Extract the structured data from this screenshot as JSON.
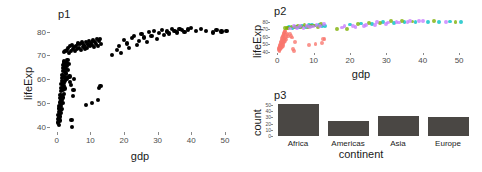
{
  "figure": {
    "layout": "three-panel-patchwork",
    "background": "#ffffff"
  },
  "panels": {
    "p1": {
      "title": "p1",
      "xlabel": "gdp",
      "ylabel": "lifeExp"
    },
    "p2": {
      "title": "p2",
      "xlabel": "gdp",
      "ylabel": "lifeExp"
    },
    "p3": {
      "title": "p3",
      "xlabel": "continent",
      "ylabel": "count"
    }
  },
  "colors": {
    "point_black": "#000000",
    "bar_fill": "#4a4744",
    "africa": "#F8766D",
    "americas": "#7CAE00",
    "asia": "#00BFC4",
    "europe": "#C77CFF",
    "axis_text": "#4d4d4d",
    "label_text": "#1a1a1a"
  },
  "chart_data": [
    {
      "id": "p1",
      "type": "scatter",
      "title": "p1",
      "xlabel": "gdp",
      "ylabel": "lifeExp",
      "xlim": [
        -2,
        53
      ],
      "ylim": [
        38,
        84
      ],
      "xticks": [
        0,
        10,
        20,
        30,
        40,
        50
      ],
      "yticks": [
        40,
        50,
        60,
        70,
        80
      ],
      "grid": false,
      "legend": "none",
      "point_color": "#000000",
      "points": [
        [
          0.4,
          42.0
        ],
        [
          0.5,
          43.5
        ],
        [
          0.5,
          45.2
        ],
        [
          0.6,
          41.0
        ],
        [
          0.6,
          46.5
        ],
        [
          0.7,
          44.1
        ],
        [
          0.7,
          47.8
        ],
        [
          0.8,
          42.8
        ],
        [
          0.8,
          48.9
        ],
        [
          0.9,
          46.0
        ],
        [
          0.9,
          50.3
        ],
        [
          1.0,
          44.5
        ],
        [
          1.0,
          52.1
        ],
        [
          1.1,
          47.2
        ],
        [
          1.1,
          53.6
        ],
        [
          1.2,
          45.8
        ],
        [
          1.2,
          55.0
        ],
        [
          1.3,
          49.0
        ],
        [
          1.3,
          56.4
        ],
        [
          1.4,
          51.5
        ],
        [
          1.4,
          58.0
        ],
        [
          1.5,
          47.5
        ],
        [
          1.5,
          59.3
        ],
        [
          1.6,
          53.2
        ],
        [
          1.6,
          60.7
        ],
        [
          1.7,
          50.0
        ],
        [
          1.7,
          62.0
        ],
        [
          1.8,
          55.8
        ],
        [
          1.8,
          63.4
        ],
        [
          1.9,
          52.4
        ],
        [
          1.9,
          64.8
        ],
        [
          2.0,
          57.1
        ],
        [
          2.0,
          65.9
        ],
        [
          2.1,
          54.0
        ],
        [
          2.1,
          66.8
        ],
        [
          2.2,
          58.6
        ],
        [
          2.2,
          67.5
        ],
        [
          2.3,
          56.2
        ],
        [
          2.3,
          61.0
        ],
        [
          2.4,
          63.0
        ],
        [
          2.4,
          65.0
        ],
        [
          2.5,
          59.5
        ],
        [
          2.6,
          66.2
        ],
        [
          2.7,
          62.5
        ],
        [
          2.8,
          64.2
        ],
        [
          2.9,
          67.0
        ],
        [
          3.0,
          60.4
        ],
        [
          3.1,
          65.5
        ],
        [
          3.2,
          68.0
        ],
        [
          3.4,
          63.8
        ],
        [
          3.6,
          66.5
        ],
        [
          3.8,
          61.2
        ],
        [
          4.0,
          59.0
        ],
        [
          4.2,
          57.5
        ],
        [
          4.4,
          43.0
        ],
        [
          4.6,
          40.2
        ],
        [
          4.8,
          53.0
        ],
        [
          5.0,
          55.5
        ],
        [
          5.2,
          60.0
        ],
        [
          2.2,
          71.5
        ],
        [
          2.6,
          71.8
        ],
        [
          3.0,
          72.3
        ],
        [
          3.3,
          73.0
        ],
        [
          3.6,
          71.2
        ],
        [
          3.9,
          73.8
        ],
        [
          4.2,
          72.0
        ],
        [
          4.5,
          74.5
        ],
        [
          4.8,
          72.8
        ],
        [
          5.1,
          73.4
        ],
        [
          5.4,
          71.9
        ],
        [
          5.7,
          74.0
        ],
        [
          6.0,
          72.6
        ],
        [
          6.3,
          75.0
        ],
        [
          6.6,
          73.2
        ],
        [
          6.9,
          74.8
        ],
        [
          7.2,
          72.2
        ],
        [
          7.5,
          75.4
        ],
        [
          7.8,
          73.6
        ],
        [
          8.1,
          74.2
        ],
        [
          8.4,
          72.9
        ],
        [
          8.7,
          75.8
        ],
        [
          9.0,
          73.1
        ],
        [
          9.3,
          74.6
        ],
        [
          9.6,
          76.0
        ],
        [
          9.9,
          73.9
        ],
        [
          10.2,
          75.2
        ],
        [
          10.5,
          74.4
        ],
        [
          10.8,
          76.3
        ],
        [
          11.1,
          73.5
        ],
        [
          11.4,
          75.6
        ],
        [
          11.7,
          74.9
        ],
        [
          12.0,
          76.8
        ],
        [
          12.3,
          74.1
        ],
        [
          12.6,
          75.9
        ],
        [
          12.9,
          77.0
        ],
        [
          13.2,
          74.7
        ],
        [
          8.8,
          49.2
        ],
        [
          10.5,
          50.0
        ],
        [
          12.2,
          51.5
        ],
        [
          12.6,
          56.5
        ],
        [
          13.0,
          57.2
        ],
        [
          16.5,
          70.2
        ],
        [
          17.8,
          72.4
        ],
        [
          18.5,
          74.0
        ],
        [
          19.2,
          71.0
        ],
        [
          20.0,
          76.5
        ],
        [
          20.8,
          75.0
        ],
        [
          21.5,
          73.0
        ],
        [
          22.3,
          77.2
        ],
        [
          23.0,
          78.0
        ],
        [
          23.8,
          74.5
        ],
        [
          24.5,
          76.0
        ],
        [
          25.2,
          79.0
        ],
        [
          26.0,
          77.5
        ],
        [
          26.8,
          75.5
        ],
        [
          27.5,
          79.8
        ],
        [
          28.2,
          78.2
        ],
        [
          29.0,
          80.2
        ],
        [
          29.8,
          76.8
        ],
        [
          30.5,
          79.4
        ],
        [
          31.2,
          80.8
        ],
        [
          32.0,
          78.6
        ],
        [
          32.8,
          80.0
        ],
        [
          33.5,
          79.2
        ],
        [
          34.2,
          81.0
        ],
        [
          35.0,
          80.4
        ],
        [
          35.8,
          79.6
        ],
        [
          36.5,
          81.2
        ],
        [
          37.2,
          80.6
        ],
        [
          38.0,
          79.9
        ],
        [
          39.0,
          80.9
        ],
        [
          40.0,
          81.4
        ],
        [
          41.5,
          80.1
        ],
        [
          43.0,
          81.0
        ],
        [
          44.5,
          80.3
        ],
        [
          46.5,
          79.6
        ],
        [
          47.5,
          80.6
        ],
        [
          49.0,
          80.0
        ],
        [
          50.5,
          80.4
        ]
      ]
    },
    {
      "id": "p2",
      "type": "scatter",
      "title": "p2",
      "xlabel": "gdp",
      "ylabel": "lifeExp",
      "xlim": [
        -2,
        53
      ],
      "ylim": [
        38,
        84
      ],
      "xticks": [
        0,
        10,
        20,
        30,
        40,
        50
      ],
      "yticks": [
        40,
        50,
        60,
        70,
        80
      ],
      "grid": false,
      "legend": "none",
      "color_by": "continent",
      "series": [
        {
          "name": "Africa",
          "color": "#F8766D",
          "points": [
            [
              0.4,
              42.0
            ],
            [
              0.5,
              43.5
            ],
            [
              0.5,
              45.2
            ],
            [
              0.6,
              41.0
            ],
            [
              0.6,
              46.5
            ],
            [
              0.7,
              44.1
            ],
            [
              0.7,
              47.8
            ],
            [
              0.8,
              42.8
            ],
            [
              0.8,
              48.9
            ],
            [
              0.9,
              46.0
            ],
            [
              0.9,
              50.3
            ],
            [
              1.0,
              44.5
            ],
            [
              1.0,
              52.1
            ],
            [
              1.1,
              47.2
            ],
            [
              1.1,
              53.6
            ],
            [
              1.2,
              45.8
            ],
            [
              1.2,
              55.0
            ],
            [
              1.3,
              49.0
            ],
            [
              1.3,
              56.4
            ],
            [
              1.4,
              51.5
            ],
            [
              1.4,
              58.0
            ],
            [
              1.5,
              47.5
            ],
            [
              1.5,
              59.3
            ],
            [
              1.6,
              53.2
            ],
            [
              1.6,
              60.7
            ],
            [
              1.7,
              50.0
            ],
            [
              1.7,
              62.0
            ],
            [
              1.8,
              55.8
            ],
            [
              1.8,
              63.4
            ],
            [
              1.9,
              52.4
            ],
            [
              1.9,
              64.8
            ],
            [
              2.0,
              57.1
            ],
            [
              2.0,
              65.9
            ],
            [
              2.1,
              54.0
            ],
            [
              2.1,
              66.8
            ],
            [
              2.2,
              58.6
            ],
            [
              2.2,
              67.5
            ],
            [
              2.3,
              56.2
            ],
            [
              2.4,
              63.0
            ],
            [
              2.5,
              59.5
            ],
            [
              2.8,
              64.2
            ],
            [
              3.0,
              60.4
            ],
            [
              3.4,
              63.8
            ],
            [
              3.8,
              61.2
            ],
            [
              4.0,
              59.0
            ],
            [
              4.4,
              43.0
            ],
            [
              4.6,
              40.2
            ],
            [
              4.8,
              53.0
            ],
            [
              8.8,
              49.2
            ],
            [
              10.5,
              50.0
            ],
            [
              12.2,
              51.5
            ],
            [
              12.6,
              56.5
            ],
            [
              13.0,
              57.2
            ]
          ]
        },
        {
          "name": "Americas",
          "color": "#00BFC4",
          "points": [
            [
              3.3,
              73.0
            ],
            [
              4.2,
              72.0
            ],
            [
              5.1,
              73.4
            ],
            [
              6.0,
              72.6
            ],
            [
              6.9,
              74.8
            ],
            [
              7.8,
              73.6
            ],
            [
              8.7,
              75.8
            ],
            [
              9.6,
              76.0
            ],
            [
              10.5,
              75.2
            ],
            [
              11.4,
              75.6
            ],
            [
              12.3,
              74.1
            ],
            [
              13.2,
              74.7
            ],
            [
              20.0,
              76.5
            ],
            [
              23.0,
              78.0
            ],
            [
              26.0,
              77.5
            ],
            [
              29.0,
              80.2
            ],
            [
              32.0,
              78.6
            ],
            [
              35.0,
              80.4
            ],
            [
              38.0,
              79.9
            ],
            [
              41.5,
              80.1
            ],
            [
              44.5,
              80.3
            ],
            [
              47.5,
              80.6
            ],
            [
              50.5,
              80.4
            ]
          ]
        },
        {
          "name": "Asia",
          "color": "#7CAE00",
          "points": [
            [
              2.2,
              71.5
            ],
            [
              2.6,
              71.8
            ],
            [
              3.0,
              72.3
            ],
            [
              3.9,
              73.8
            ],
            [
              4.8,
              72.8
            ],
            [
              5.7,
              74.0
            ],
            [
              6.6,
              73.2
            ],
            [
              7.5,
              75.4
            ],
            [
              8.4,
              72.9
            ],
            [
              9.3,
              74.6
            ],
            [
              10.2,
              75.2
            ],
            [
              11.1,
              73.5
            ],
            [
              12.0,
              76.8
            ],
            [
              16.5,
              70.2
            ],
            [
              19.2,
              71.0
            ],
            [
              22.3,
              77.2
            ],
            [
              25.2,
              79.0
            ],
            [
              28.2,
              78.2
            ],
            [
              31.2,
              80.8
            ],
            [
              34.2,
              81.0
            ],
            [
              37.2,
              80.6
            ],
            [
              43.0,
              81.0
            ],
            [
              49.0,
              80.0
            ]
          ]
        },
        {
          "name": "Europe",
          "color": "#C77CFF",
          "points": [
            [
              3.6,
              71.2
            ],
            [
              4.5,
              74.5
            ],
            [
              5.4,
              71.9
            ],
            [
              6.3,
              75.0
            ],
            [
              7.2,
              72.2
            ],
            [
              8.1,
              74.2
            ],
            [
              9.0,
              73.1
            ],
            [
              9.9,
              73.9
            ],
            [
              10.8,
              76.3
            ],
            [
              11.7,
              74.9
            ],
            [
              12.9,
              77.0
            ],
            [
              17.8,
              72.4
            ],
            [
              18.5,
              74.0
            ],
            [
              20.8,
              75.0
            ],
            [
              21.5,
              73.0
            ],
            [
              23.8,
              74.5
            ],
            [
              24.5,
              76.0
            ],
            [
              26.8,
              75.5
            ],
            [
              27.5,
              79.8
            ],
            [
              29.8,
              76.8
            ],
            [
              30.5,
              79.4
            ],
            [
              32.8,
              80.0
            ],
            [
              33.5,
              79.2
            ],
            [
              35.8,
              79.6
            ],
            [
              36.5,
              81.2
            ],
            [
              39.0,
              80.9
            ],
            [
              40.0,
              81.4
            ],
            [
              46.5,
              79.6
            ]
          ]
        }
      ]
    },
    {
      "id": "p3",
      "type": "bar",
      "title": "p3",
      "xlabel": "continent",
      "ylabel": "count",
      "categories": [
        "Africa",
        "Americas",
        "Asia",
        "Europe"
      ],
      "values": [
        52,
        25,
        33,
        30
      ],
      "yticks": [
        0,
        10,
        20,
        30,
        40,
        50
      ],
      "ylim": [
        0,
        55
      ],
      "grid": false,
      "legend": "none",
      "bar_color": "#4a4744"
    }
  ]
}
